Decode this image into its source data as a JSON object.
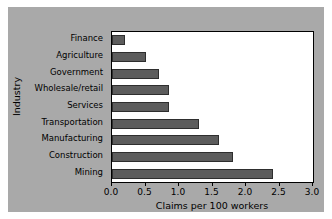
{
  "chart_data": {
    "type": "bar",
    "orientation": "horizontal",
    "title": "",
    "xlabel": "Claims per 100 workers",
    "ylabel": "Industry",
    "categories": [
      "Finance",
      "Agriculture",
      "Government",
      "Wholesale/retail",
      "Services",
      "Transportation",
      "Manufacturing",
      "Construction",
      "Mining"
    ],
    "values": [
      0.2,
      0.5,
      0.7,
      0.85,
      0.85,
      1.3,
      1.6,
      1.8,
      2.4
    ],
    "xlim": [
      0.0,
      3.0
    ],
    "xticks": [
      0.0,
      0.5,
      1.0,
      1.5,
      2.0,
      2.5,
      3.0
    ],
    "xtick_labels": [
      "0.0",
      "0.5",
      "1.0",
      "1.5",
      "2.0",
      "2.5",
      "3.0"
    ],
    "grid": false,
    "legend": null,
    "bar_color": "#5c5c5c",
    "bar_edge_color": "#2e2e2e",
    "plot_background": "#ffffff",
    "figure_background": "#a9a9a9",
    "axis_color": "#000000"
  }
}
